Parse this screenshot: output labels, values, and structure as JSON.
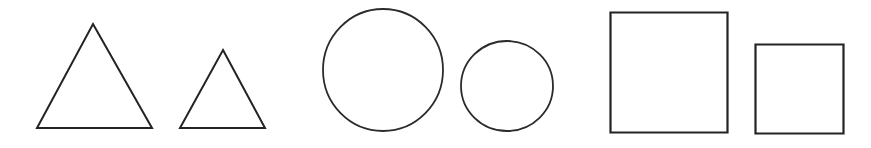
{
  "figure": {
    "background_color": "#ffffff",
    "stroke_color": "#232323",
    "width": 871,
    "height": 148,
    "shape_count": 6
  },
  "chart_data": {
    "type": "diagram",
    "xlabel": "",
    "ylabel": "",
    "shapes": [
      {
        "index": 1,
        "name": "large-triangle",
        "kind": "triangle",
        "size": "large",
        "stroke": "#232323",
        "fill": "none",
        "stroke_width": 2.0,
        "points": "93,24 152,128 37,128",
        "bbox": {
          "x": 37,
          "y": 24,
          "width": 115,
          "height": 104
        }
      },
      {
        "index": 2,
        "name": "small-triangle",
        "kind": "triangle",
        "size": "small",
        "stroke": "#232323",
        "fill": "none",
        "stroke_width": 2.0,
        "points": "223,50 265,128 180,128",
        "bbox": {
          "x": 180,
          "y": 50,
          "width": 85,
          "height": 78
        }
      },
      {
        "index": 3,
        "name": "large-circle",
        "kind": "circle",
        "size": "large",
        "stroke": "#232323",
        "fill": "none",
        "stroke_width": 1.8,
        "cx": 383,
        "cy": 70,
        "rx": 60,
        "ry": 61,
        "bbox": {
          "x": 323,
          "y": 9,
          "width": 120,
          "height": 122
        }
      },
      {
        "index": 4,
        "name": "small-circle",
        "kind": "circle",
        "size": "small",
        "stroke": "#232323",
        "fill": "none",
        "stroke_width": 1.8,
        "cx": 507,
        "cy": 86,
        "rx": 46,
        "ry": 45,
        "bbox": {
          "x": 461,
          "y": 41,
          "width": 92,
          "height": 91
        }
      },
      {
        "index": 5,
        "name": "large-square",
        "kind": "square",
        "size": "large",
        "stroke": "#232323",
        "fill": "none",
        "stroke_width": 2.2,
        "bbox": {
          "x": 610,
          "y": 12,
          "width": 118,
          "height": 121
        }
      },
      {
        "index": 6,
        "name": "small-square",
        "kind": "square",
        "size": "small",
        "stroke": "#232323",
        "fill": "none",
        "stroke_width": 2.2,
        "bbox": {
          "x": 755,
          "y": 44,
          "width": 89,
          "height": 90
        }
      }
    ],
    "labels": [],
    "legend": [],
    "grid": false
  }
}
